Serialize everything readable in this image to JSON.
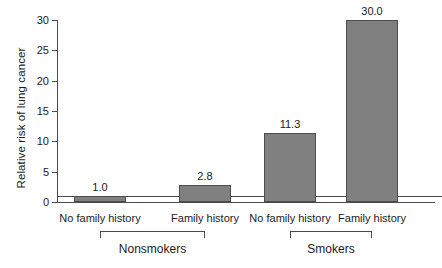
{
  "chart_data": {
    "type": "bar",
    "title": "",
    "xlabel": "",
    "ylabel": "Relative risk of lung cancer",
    "ylim": [
      0,
      30
    ],
    "grid": false,
    "legend": "none",
    "yticks": [
      0,
      5,
      10,
      15,
      20,
      25,
      30
    ],
    "ytick_labels": [
      "0",
      "5",
      "10",
      "15",
      "20",
      "25",
      "30"
    ],
    "categories": [
      "No family history",
      "Family history",
      "No family history",
      "Family history"
    ],
    "values": [
      1.0,
      2.8,
      11.3,
      30.0
    ],
    "value_labels": [
      "1.0",
      "2.8",
      "11.3",
      "30.0"
    ],
    "groups": [
      {
        "label": "Nonsmokers",
        "categories": [
          0,
          1
        ]
      },
      {
        "label": "Smokers",
        "categories": [
          2,
          3
        ]
      }
    ],
    "reference_line": 1.0,
    "bar_color": "#808080",
    "bar_edge_color": "#4d4d4d",
    "axis_color": "#4a4a4a"
  }
}
